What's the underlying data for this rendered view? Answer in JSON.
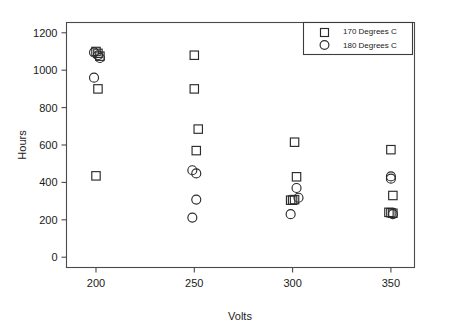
{
  "chart_data": {
    "type": "scatter",
    "title": "",
    "xlabel": "Volts",
    "ylabel": "Hours",
    "xlim": [
      185,
      362
    ],
    "ylim": [
      -55,
      1255
    ],
    "xticks": [
      200,
      250,
      300,
      350
    ],
    "yticks": [
      0,
      200,
      400,
      600,
      800,
      1000,
      1200
    ],
    "grid": false,
    "legend_position": "top-right",
    "series": [
      {
        "name": "170 Degrees C",
        "marker": "square",
        "points": [
          [
            200,
            1100
          ],
          [
            201,
            1090
          ],
          [
            202,
            1075
          ],
          [
            201,
            900
          ],
          [
            200,
            435
          ],
          [
            250,
            1080
          ],
          [
            250,
            900
          ],
          [
            252,
            685
          ],
          [
            251,
            570
          ],
          [
            301,
            615
          ],
          [
            302,
            430
          ],
          [
            299,
            305
          ],
          [
            300,
            305
          ],
          [
            301,
            308
          ],
          [
            350,
            575
          ],
          [
            351,
            330
          ],
          [
            349,
            240
          ],
          [
            350,
            238
          ],
          [
            351,
            235
          ]
        ]
      },
      {
        "name": "180 Degrees C",
        "marker": "circle",
        "points": [
          [
            199,
            1095
          ],
          [
            201,
            1080
          ],
          [
            202,
            1065
          ],
          [
            199,
            960
          ],
          [
            249,
            465
          ],
          [
            251,
            448
          ],
          [
            251,
            308
          ],
          [
            249,
            212
          ],
          [
            302,
            370
          ],
          [
            303,
            318
          ],
          [
            299,
            230
          ],
          [
            350,
            432
          ],
          [
            350,
            420
          ],
          [
            351,
            230
          ]
        ]
      }
    ]
  },
  "legend": {
    "entries": [
      {
        "label": "170 Degrees C",
        "marker": "square"
      },
      {
        "label": "180 Degrees C",
        "marker": "circle"
      }
    ]
  }
}
